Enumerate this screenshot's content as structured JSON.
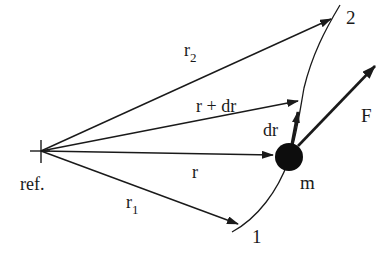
{
  "diagram": {
    "labels": {
      "ref": "ref.",
      "r1": "r",
      "r1_sub": "1",
      "r2": "r",
      "r2_sub": "2",
      "r_plus_dr": "r + dr",
      "r": "r",
      "dr": "dr",
      "force": "F",
      "mass": "m",
      "point1": "1",
      "point2": "2"
    },
    "colors": {
      "ink": "#1a1a1a",
      "background": "#ffffff"
    }
  }
}
